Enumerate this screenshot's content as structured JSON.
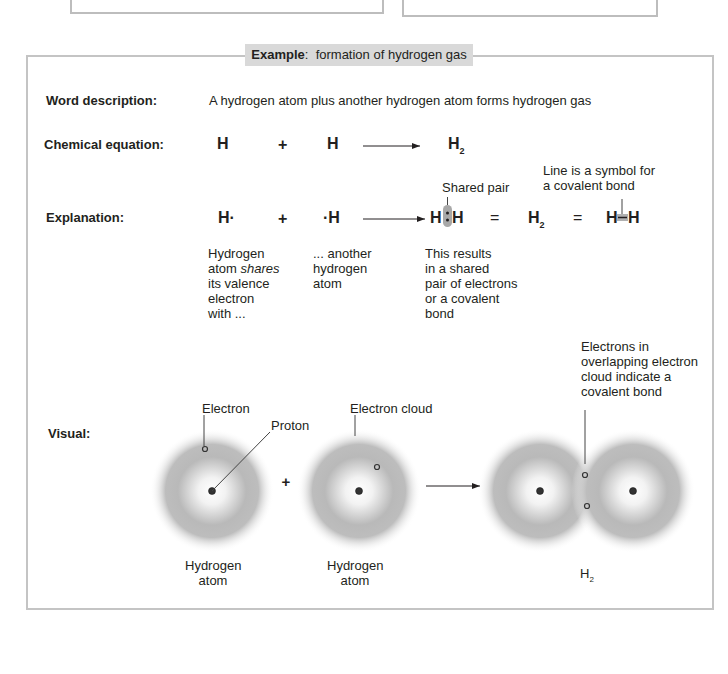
{
  "title": {
    "prefix": "Example",
    "colon": ":",
    "text": "formation of hydrogen gas"
  },
  "rows": {
    "word_description": {
      "label": "Word description:",
      "text": "A hydrogen atom plus another hydrogen atom forms hydrogen gas"
    },
    "chemical_equation": {
      "label": "Chemical equation:",
      "reactant1": "H",
      "plus": "+",
      "reactant2": "H",
      "arrow": "arrow-right-icon",
      "product": "H",
      "product_subscript": "2"
    },
    "explanation": {
      "label": "Explanation:",
      "lewis1": "H·",
      "plus": "+",
      "lewis2": "·H",
      "shared_pair_label": "Shared pair",
      "shared_pair_left": "H",
      "shared_pair_right": "H",
      "equals1": "=",
      "molecule": "H",
      "molecule_subscript": "2",
      "equals2": "=",
      "bond_left": "H",
      "bond_right": "H",
      "line_note": "Line is a symbol for\na covalent bond",
      "note1": "Hydrogen\natom shares\nits valence\nelectron\nwith ...",
      "note1_parts": [
        "Hydrogen\natom ",
        "shares",
        "\nits valence\nelectron\nwith ..."
      ],
      "note2": "... another\nhydrogen\natom",
      "note3": "This results\nin a shared\npair of electrons\nor a covalent\nbond"
    },
    "visual": {
      "label": "Visual:",
      "electron_label": "Electron",
      "proton_label": "Proton",
      "cloud_label": "Electron cloud",
      "overlap_note": "Electrons in\noverlapping electron\ncloud indicate a\ncovalent bond",
      "atom1_caption": "Hydrogen\natom",
      "atom2_caption": "Hydrogen\natom",
      "plus": "+",
      "product_caption": "H",
      "product_caption_subscript": "2"
    }
  },
  "colors": {
    "frame_border": "#c4c4c4",
    "title_bg": "#d9d9d9",
    "cloud": "#9e9e9e",
    "text": "#231f20",
    "bond_highlight": "#a8a8a8"
  }
}
